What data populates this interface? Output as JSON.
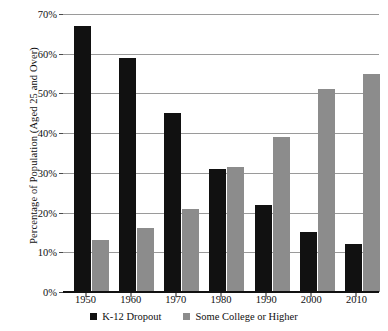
{
  "chart_data": {
    "type": "bar",
    "title": "",
    "xlabel": "",
    "ylabel": "Percentage of Population (Aged 25 and Over)",
    "categories": [
      "1950",
      "1960",
      "1970",
      "1980",
      "1990",
      "2000",
      "2010"
    ],
    "series": [
      {
        "name": "K-12 Dropout",
        "color": "#111111",
        "values": [
          67,
          59,
          45,
          31,
          22,
          15,
          12
        ]
      },
      {
        "name": "Some College or Higher",
        "color": "#8c8c8c",
        "values": [
          13,
          16,
          21,
          31.5,
          39,
          51,
          55
        ]
      }
    ],
    "ylim": [
      0,
      70
    ],
    "ytick_values": [
      0,
      10,
      20,
      30,
      40,
      50,
      60,
      70
    ],
    "ytick_labels": [
      "0%",
      "10%",
      "20%",
      "30%",
      "40%",
      "50%",
      "60%",
      "70%"
    ],
    "grid": true,
    "legend_position": "bottom"
  },
  "legend": {
    "items": [
      {
        "label": "K-12 Dropout"
      },
      {
        "label": "Some College or Higher"
      }
    ]
  }
}
